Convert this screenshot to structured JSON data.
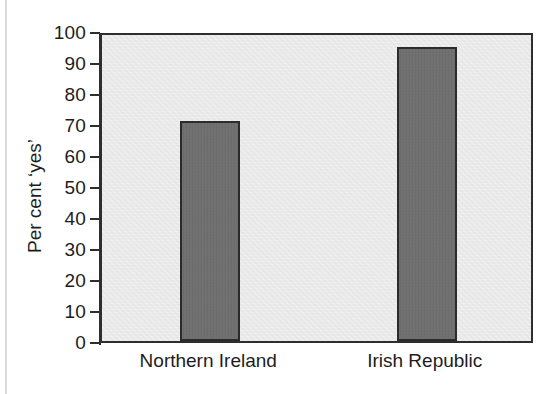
{
  "chart_data": {
    "type": "bar",
    "title": "",
    "xlabel": "",
    "ylabel": "Per cent ‘yes’",
    "categories": [
      "Northern Ireland",
      "Irish Republic"
    ],
    "values": [
      71,
      95
    ],
    "ylim": [
      0,
      100
    ],
    "y_ticks": [
      0,
      10,
      20,
      30,
      40,
      50,
      60,
      70,
      80,
      90,
      100
    ],
    "y_tick_labels": [
      "0",
      "10",
      "20",
      "30",
      "40",
      "50",
      "60",
      "70",
      "80",
      "90",
      "100"
    ],
    "grid": false,
    "legend": "none",
    "series": [
      {
        "name": "Per cent ‘yes’",
        "values": [
          71,
          95
        ]
      }
    ],
    "annotations": []
  },
  "style": {
    "bar_fill": "#6d6d6d",
    "bar_stroke": "#2b2b2b",
    "plot_background": "#e9e9e9",
    "axis_color": "#2e2e2e",
    "text_color": "#1d1d1d",
    "page_background": "#ffffff"
  },
  "figure": {
    "y_axis_title": "Per cent ‘yes’",
    "bar_labels": [
      "Northern Ireland",
      "Irish Republic"
    ]
  }
}
